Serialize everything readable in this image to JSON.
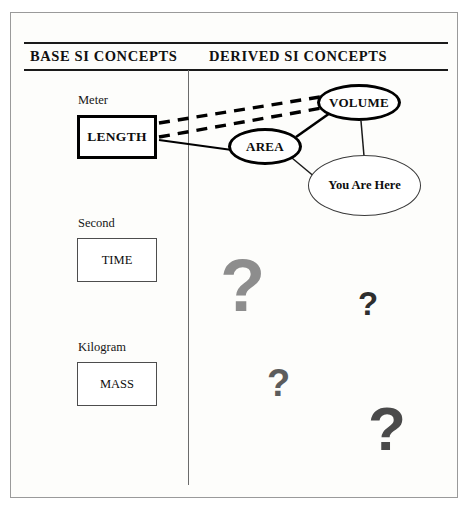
{
  "diagram": {
    "title_columns": {
      "base": "BASE SI CONCEPTS",
      "derived": "DERIVED SI CONCEPTS"
    },
    "base_concepts": [
      {
        "unit": "Meter",
        "concept": "LENGTH",
        "emphasis": "strong"
      },
      {
        "unit": "Second",
        "concept": "TIME",
        "emphasis": "normal"
      },
      {
        "unit": "Kilogram",
        "concept": "MASS",
        "emphasis": "normal"
      }
    ],
    "derived_concepts": [
      {
        "concept": "AREA",
        "emphasis": "strong"
      },
      {
        "concept": "VOLUME",
        "emphasis": "strong"
      },
      {
        "concept": "You Are Here",
        "emphasis": "normal"
      }
    ],
    "connections": [
      {
        "from": "LENGTH",
        "to": "VOLUME",
        "style": "dashed"
      },
      {
        "from": "LENGTH",
        "to": "VOLUME",
        "style": "dashed"
      },
      {
        "from": "LENGTH",
        "to": "AREA",
        "style": "solid"
      },
      {
        "from": "AREA",
        "to": "VOLUME",
        "style": "solid"
      },
      {
        "from": "AREA",
        "to": "You Are Here",
        "style": "solid"
      },
      {
        "from": "VOLUME",
        "to": "You Are Here",
        "style": "solid"
      }
    ],
    "question_marks": [
      {
        "glyph": "?",
        "shade": "#8d8d8d",
        "size": "large"
      },
      {
        "glyph": "?",
        "shade": "#2e2e2e",
        "size": "small"
      },
      {
        "glyph": "?",
        "shade": "#5c5c5c",
        "size": "small"
      },
      {
        "glyph": "?",
        "shade": "#4a4a4a",
        "size": "large"
      }
    ],
    "colors": {
      "ink": "#000000",
      "frame": "#9a9a9a",
      "page": "#fdfdfb"
    }
  }
}
